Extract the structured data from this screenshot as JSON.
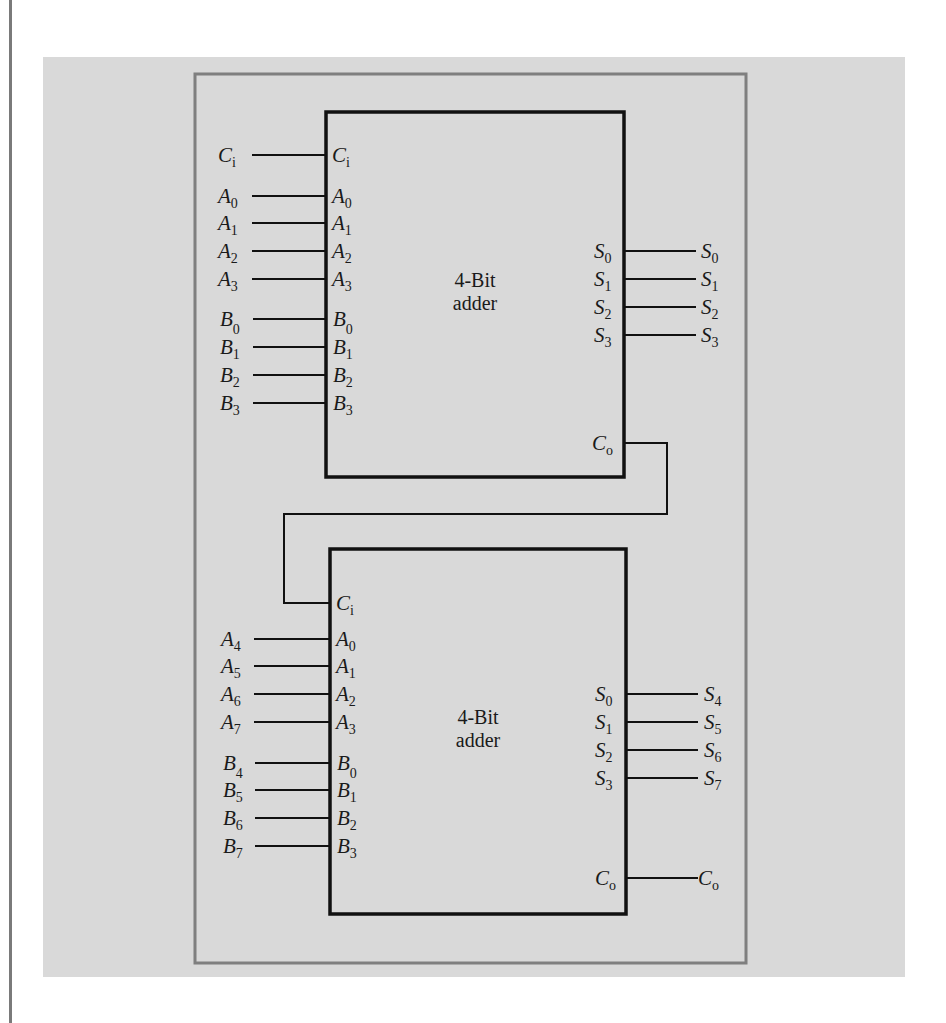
{
  "figure": {
    "background_panel_color": "#d9d9d9",
    "frame_color": "#7f7f7f",
    "line_color": "#111111",
    "adders": [
      {
        "id": "adder-low",
        "title_line1": "4-Bit",
        "title_line2": "adder",
        "inputs": [
          {
            "external": {
              "base": "C",
              "sub": "i"
            },
            "pin": {
              "base": "C",
              "sub": "i"
            }
          },
          {
            "external": {
              "base": "A",
              "sub": "0"
            },
            "pin": {
              "base": "A",
              "sub": "0"
            }
          },
          {
            "external": {
              "base": "A",
              "sub": "1"
            },
            "pin": {
              "base": "A",
              "sub": "1"
            }
          },
          {
            "external": {
              "base": "A",
              "sub": "2"
            },
            "pin": {
              "base": "A",
              "sub": "2"
            }
          },
          {
            "external": {
              "base": "A",
              "sub": "3"
            },
            "pin": {
              "base": "A",
              "sub": "3"
            }
          },
          {
            "external": {
              "base": "B",
              "sub": "0"
            },
            "pin": {
              "base": "B",
              "sub": "0"
            }
          },
          {
            "external": {
              "base": "B",
              "sub": "1"
            },
            "pin": {
              "base": "B",
              "sub": "1"
            }
          },
          {
            "external": {
              "base": "B",
              "sub": "2"
            },
            "pin": {
              "base": "B",
              "sub": "2"
            }
          },
          {
            "external": {
              "base": "B",
              "sub": "3"
            },
            "pin": {
              "base": "B",
              "sub": "3"
            }
          }
        ],
        "outputs": [
          {
            "pin": {
              "base": "S",
              "sub": "0"
            },
            "external": {
              "base": "S",
              "sub": "0"
            }
          },
          {
            "pin": {
              "base": "S",
              "sub": "1"
            },
            "external": {
              "base": "S",
              "sub": "1"
            }
          },
          {
            "pin": {
              "base": "S",
              "sub": "2"
            },
            "external": {
              "base": "S",
              "sub": "2"
            }
          },
          {
            "pin": {
              "base": "S",
              "sub": "3"
            },
            "external": {
              "base": "S",
              "sub": "3"
            }
          }
        ],
        "carry_out": {
          "pin": {
            "base": "C",
            "sub": "o"
          }
        }
      },
      {
        "id": "adder-high",
        "title_line1": "4-Bit",
        "title_line2": "adder",
        "carry_in": {
          "pin": {
            "base": "C",
            "sub": "i"
          }
        },
        "inputs": [
          {
            "external": {
              "base": "A",
              "sub": "4"
            },
            "pin": {
              "base": "A",
              "sub": "0"
            }
          },
          {
            "external": {
              "base": "A",
              "sub": "5"
            },
            "pin": {
              "base": "A",
              "sub": "1"
            }
          },
          {
            "external": {
              "base": "A",
              "sub": "6"
            },
            "pin": {
              "base": "A",
              "sub": "2"
            }
          },
          {
            "external": {
              "base": "A",
              "sub": "7"
            },
            "pin": {
              "base": "A",
              "sub": "3"
            }
          },
          {
            "external": {
              "base": "B",
              "sub": "4"
            },
            "pin": {
              "base": "B",
              "sub": "0"
            }
          },
          {
            "external": {
              "base": "B",
              "sub": "5"
            },
            "pin": {
              "base": "B",
              "sub": "1"
            }
          },
          {
            "external": {
              "base": "B",
              "sub": "6"
            },
            "pin": {
              "base": "B",
              "sub": "2"
            }
          },
          {
            "external": {
              "base": "B",
              "sub": "7"
            },
            "pin": {
              "base": "B",
              "sub": "3"
            }
          }
        ],
        "outputs": [
          {
            "pin": {
              "base": "S",
              "sub": "0"
            },
            "external": {
              "base": "S",
              "sub": "4"
            }
          },
          {
            "pin": {
              "base": "S",
              "sub": "1"
            },
            "external": {
              "base": "S",
              "sub": "5"
            }
          },
          {
            "pin": {
              "base": "S",
              "sub": "2"
            },
            "external": {
              "base": "S",
              "sub": "6"
            }
          },
          {
            "pin": {
              "base": "S",
              "sub": "3"
            },
            "external": {
              "base": "S",
              "sub": "7"
            }
          }
        ],
        "carry_out": {
          "pin": {
            "base": "C",
            "sub": "o"
          },
          "external": {
            "base": "C",
            "sub": "o"
          }
        }
      }
    ]
  }
}
